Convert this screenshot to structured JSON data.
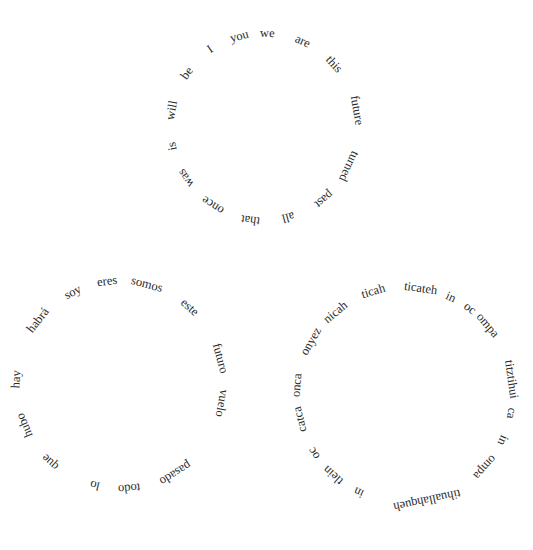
{
  "circles": [
    {
      "language": "English",
      "center": [
        264,
        127
      ],
      "radius": 94,
      "words": [
        {
          "text": "we",
          "angle": 2
        },
        {
          "text": "are",
          "angle": 24
        },
        {
          "text": "this",
          "angle": 48
        },
        {
          "text": "future",
          "angle": 80
        },
        {
          "text": "turned",
          "angle": 115
        },
        {
          "text": "past",
          "angle": 140
        },
        {
          "text": "all",
          "angle": 165
        },
        {
          "text": "that",
          "angle": 188
        },
        {
          "text": "once",
          "angle": 213
        },
        {
          "text": "was",
          "angle": 237
        },
        {
          "text": "is",
          "angle": 258
        },
        {
          "text": "will",
          "angle": 280
        },
        {
          "text": "be",
          "angle": 305
        },
        {
          "text": "I",
          "angle": 325
        },
        {
          "text": "you",
          "angle": 345
        }
      ]
    },
    {
      "language": "Spanish",
      "center": [
        120,
        385
      ],
      "radius": 104,
      "words": [
        {
          "text": "eres",
          "angle": 353
        },
        {
          "text": "somos",
          "angle": 15
        },
        {
          "text": "este",
          "angle": 42
        },
        {
          "text": "futuro",
          "angle": 75
        },
        {
          "text": "vuelo",
          "angle": 100
        },
        {
          "text": "pasado",
          "angle": 148
        },
        {
          "text": "todo",
          "angle": 175
        },
        {
          "text": "lo",
          "angle": 194
        },
        {
          "text": "que",
          "angle": 222
        },
        {
          "text": "hubo",
          "angle": 247
        },
        {
          "text": "hay",
          "angle": 273
        },
        {
          "text": "habrá",
          "angle": 308
        },
        {
          "text": "soy",
          "angle": 333
        }
      ]
    },
    {
      "language": "Nahuatl",
      "center": [
        405,
        395
      ],
      "radius": 108,
      "words": [
        {
          "text": "ticateh",
          "angle": 8
        },
        {
          "text": "in",
          "angle": 25
        },
        {
          "text": "oc",
          "angle": 37
        },
        {
          "text": "ompa",
          "angle": 50
        },
        {
          "text": "titztihui",
          "angle": 82
        },
        {
          "text": "ca",
          "angle": 100
        },
        {
          "text": "in",
          "angle": 115
        },
        {
          "text": "ompa",
          "angle": 132
        },
        {
          "text": "tihuallahqueh",
          "angle": 168
        },
        {
          "text": "in",
          "angle": 205
        },
        {
          "text": "tlein",
          "angle": 222
        },
        {
          "text": "oc",
          "angle": 237
        },
        {
          "text": "catca",
          "angle": 257
        },
        {
          "text": "onca",
          "angle": 275
        },
        {
          "text": "onyez",
          "angle": 300
        },
        {
          "text": "nicah",
          "angle": 320
        },
        {
          "text": "ticah",
          "angle": 343
        }
      ]
    }
  ]
}
